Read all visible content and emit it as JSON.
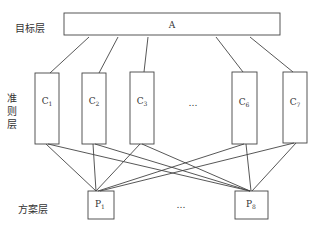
{
  "layers": {
    "goal_label": "目标层",
    "criteria_label_chars": [
      "准",
      "则",
      "层"
    ],
    "alternative_label": "方案层"
  },
  "goal": {
    "label": "A"
  },
  "criteria": [
    {
      "base": "C",
      "sub": "1"
    },
    {
      "base": "C",
      "sub": "2"
    },
    {
      "base": "C",
      "sub": "3"
    },
    {
      "base": "C",
      "sub": "6"
    },
    {
      "base": "C",
      "sub": "7"
    }
  ],
  "criteria_ellipsis": "…",
  "alternatives": [
    {
      "base": "P",
      "sub": "1"
    },
    {
      "base": "P",
      "sub": "8"
    }
  ],
  "alternatives_ellipsis": "…",
  "colors": {
    "stroke": "#444444",
    "text": "#333333",
    "background": "#ffffff"
  }
}
